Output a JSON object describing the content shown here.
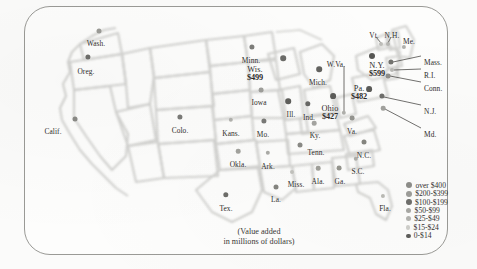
{
  "map": {
    "caption_line1": "(Value added",
    "caption_line2": "in millions of dollars)",
    "frame_color": "#9a9a96",
    "background_color": "#fdfdfc",
    "state_outline_color": "#c9c9c6"
  },
  "legend": {
    "items": [
      {
        "label": "over $400",
        "color": "#8e8e8a",
        "size": 6.2
      },
      {
        "label": "$200-$399",
        "color": "#9d9d99",
        "size": 6.0
      },
      {
        "label": "$100-$199",
        "color": "#6f6f6c",
        "size": 5.8
      },
      {
        "label": "$50-$99",
        "color": "#a8a8a4",
        "size": 5.4
      },
      {
        "label": "$25-$49",
        "color": "#b4b4b0",
        "size": 5.0
      },
      {
        "label": "$15-$24",
        "color": "#cfcfcb",
        "size": 4.4
      },
      {
        "label": "0-$14",
        "color": "#5e5e5b",
        "size": 4.6
      }
    ]
  },
  "states": [
    {
      "name": "Wash.",
      "value": null,
      "lx": 96,
      "ly": 40,
      "dx": 99,
      "dy": 31,
      "size": 5.0,
      "color": "#9b9b97",
      "align": "ctr"
    },
    {
      "name": "Oreg.",
      "value": null,
      "lx": 86,
      "ly": 68,
      "dx": 88,
      "dy": 57,
      "size": 5.2,
      "color": "#6e6e6b",
      "align": "ctr"
    },
    {
      "name": "Calif.",
      "value": null,
      "lx": 53,
      "ly": 128,
      "dx": 75,
      "dy": 119,
      "size": 5.0,
      "color": "#8a8a86",
      "align": "ctr"
    },
    {
      "name": "Colo.",
      "value": null,
      "lx": 180,
      "ly": 127,
      "dx": 180,
      "dy": 117,
      "size": 5.2,
      "color": "#7b7b78",
      "align": "ctr"
    },
    {
      "name": "Kans.",
      "value": null,
      "lx": 231,
      "ly": 130,
      "dx": 231,
      "dy": 120,
      "size": 4.4,
      "color": "#b2b2ae",
      "align": "ctr"
    },
    {
      "name": "Minn.",
      "value": null,
      "lx": 251,
      "ly": 57,
      "dx": 252,
      "dy": 47,
      "size": 5.2,
      "color": "#7d7d7a",
      "align": "ctr"
    },
    {
      "name": "Wis.",
      "value": "$499",
      "lx": 255,
      "ly": 66,
      "dx": 283,
      "dy": 58,
      "size": 5.6,
      "color": "#6c6c69",
      "align": "ctr"
    },
    {
      "name": "Iowa",
      "value": null,
      "lx": 259,
      "ly": 99,
      "dx": 261,
      "dy": 90,
      "size": 4.8,
      "color": "#9e9e9a",
      "align": "ctr"
    },
    {
      "name": "Mo.",
      "value": null,
      "lx": 263,
      "ly": 131,
      "dx": 264,
      "dy": 121,
      "size": 5.2,
      "color": "#7a7a77",
      "align": "ctr"
    },
    {
      "name": "Ill.",
      "value": null,
      "lx": 291,
      "ly": 111,
      "dx": 288,
      "dy": 101,
      "size": 5.6,
      "color": "#5f5f5c",
      "align": "ctr"
    },
    {
      "name": "Ind.",
      "value": null,
      "lx": 309,
      "ly": 114,
      "dx": 308,
      "dy": 104,
      "size": 5.4,
      "color": "#686865",
      "align": "ctr"
    },
    {
      "name": "Mich.",
      "value": null,
      "lx": 318,
      "ly": 79,
      "dx": 319,
      "dy": 69,
      "size": 5.6,
      "color": "#636360",
      "align": "ctr"
    },
    {
      "name": "Ohio",
      "value": "$427",
      "lx": 330,
      "ly": 105,
      "dx": 333,
      "dy": 96,
      "size": 5.8,
      "color": "#5c5c59",
      "align": "ctr"
    },
    {
      "name": "W.Va.",
      "value": null,
      "lx": 336,
      "ly": 61,
      "dx": 344,
      "dy": 113,
      "size": 4.4,
      "color": "#b0b0ac",
      "align": "ctr"
    },
    {
      "name": "Ky.",
      "value": null,
      "lx": 315,
      "ly": 132,
      "dx": 314,
      "dy": 123,
      "size": 4.6,
      "color": "#a5a5a1",
      "align": "ctr"
    },
    {
      "name": "Tenn.",
      "value": null,
      "lx": 316,
      "ly": 149,
      "dx": 300,
      "dy": 145,
      "size": 5.0,
      "color": "#8a8a86",
      "align": "ctr"
    },
    {
      "name": "Pa.",
      "value": "$482",
      "lx": 359,
      "ly": 85,
      "dx": 369,
      "dy": 89,
      "size": 5.8,
      "color": "#5b5b58",
      "align": "ctr"
    },
    {
      "name": "N.Y.",
      "value": "$599",
      "lx": 377,
      "ly": 62,
      "dx": 372,
      "dy": 56,
      "size": 6.0,
      "color": "#565653",
      "align": "ctr"
    },
    {
      "name": "Vt.",
      "value": null,
      "lx": 374,
      "ly": 32,
      "dx": 381,
      "dy": 44,
      "size": 4.0,
      "color": "#bdbdb9",
      "align": "ctr"
    },
    {
      "name": "N.H.",
      "value": null,
      "lx": 392,
      "ly": 32,
      "dx": 388,
      "dy": 44,
      "size": 4.0,
      "color": "#b5b5b1",
      "align": "ctr"
    },
    {
      "name": "Me.",
      "value": null,
      "lx": 409,
      "ly": 38,
      "dx": 404,
      "dy": 47,
      "size": 4.2,
      "color": "#b0b0ac",
      "align": "ctr"
    },
    {
      "name": "Mass.",
      "value": null,
      "lx": 424,
      "ly": 59,
      "dx": 391,
      "dy": 62,
      "size": 5.2,
      "color": "#73736f",
      "align": "lft"
    },
    {
      "name": "R.I.",
      "value": null,
      "lx": 424,
      "ly": 72,
      "dx": 392,
      "dy": 70,
      "size": 4.0,
      "color": "#b8b8b4",
      "align": "lft"
    },
    {
      "name": "Conn.",
      "value": null,
      "lx": 424,
      "ly": 85,
      "dx": 388,
      "dy": 76,
      "size": 4.8,
      "color": "#8e8e8a",
      "align": "lft"
    },
    {
      "name": "N.J.",
      "value": null,
      "lx": 424,
      "ly": 108,
      "dx": 382,
      "dy": 96,
      "size": 5.2,
      "color": "#6e6e6b",
      "align": "lft"
    },
    {
      "name": "Md.",
      "value": null,
      "lx": 424,
      "ly": 131,
      "dx": 383,
      "dy": 108,
      "size": 4.6,
      "color": "#a2a29e",
      "align": "lft"
    },
    {
      "name": "Va.",
      "value": null,
      "lx": 352,
      "ly": 128,
      "dx": 352,
      "dy": 118,
      "size": 4.8,
      "color": "#94948f",
      "align": "ctr"
    },
    {
      "name": "N.C.",
      "value": null,
      "lx": 364,
      "ly": 152,
      "dx": 364,
      "dy": 142,
      "size": 5.0,
      "color": "#85857f",
      "align": "ctr"
    },
    {
      "name": "S.C.",
      "value": null,
      "lx": 358,
      "ly": 168,
      "dx": 356,
      "dy": 159,
      "size": 4.4,
      "color": "#aeaea9",
      "align": "ctr"
    },
    {
      "name": "Ga.",
      "value": null,
      "lx": 340,
      "ly": 178,
      "dx": 339,
      "dy": 168,
      "size": 4.8,
      "color": "#96968f",
      "align": "ctr"
    },
    {
      "name": "Ala.",
      "value": null,
      "lx": 318,
      "ly": 178,
      "dx": 318,
      "dy": 168,
      "size": 4.6,
      "color": "#a0a09a",
      "align": "ctr"
    },
    {
      "name": "Miss.",
      "value": null,
      "lx": 296,
      "ly": 181,
      "dx": 292,
      "dy": 172,
      "size": 4.0,
      "color": "#c2c2bd",
      "align": "ctr"
    },
    {
      "name": "Ark.",
      "value": null,
      "lx": 268,
      "ly": 163,
      "dx": 268,
      "dy": 153,
      "size": 4.4,
      "color": "#acaca7",
      "align": "ctr"
    },
    {
      "name": "Okla.",
      "value": null,
      "lx": 238,
      "ly": 161,
      "dx": 238,
      "dy": 151,
      "size": 4.6,
      "color": "#a3a39e",
      "align": "ctr"
    },
    {
      "name": "La.",
      "value": null,
      "lx": 276,
      "ly": 196,
      "dx": 276,
      "dy": 187,
      "size": 5.0,
      "color": "#84847f",
      "align": "ctr"
    },
    {
      "name": "Tex.",
      "value": null,
      "lx": 226,
      "ly": 205,
      "dx": 226,
      "dy": 195,
      "size": 5.4,
      "color": "#6d6d69",
      "align": "ctr"
    },
    {
      "name": "Fla.",
      "value": null,
      "lx": 385,
      "ly": 205,
      "dx": 383,
      "dy": 196,
      "size": 4.2,
      "color": "#bbbbb6",
      "align": "ctr"
    }
  ],
  "leaders": [
    {
      "name": "leader-wva",
      "x1": 344,
      "y1": 66,
      "x2": 344,
      "y2": 112
    },
    {
      "name": "leader-vt",
      "x1": 376,
      "y1": 37,
      "x2": 381,
      "y2": 43
    },
    {
      "name": "leader-nh",
      "x1": 391,
      "y1": 37,
      "x2": 388,
      "y2": 43
    },
    {
      "name": "leader-mass",
      "x1": 421,
      "y1": 56,
      "x2": 393,
      "y2": 62
    },
    {
      "name": "leader-ri",
      "x1": 421,
      "y1": 69,
      "x2": 394,
      "y2": 70
    },
    {
      "name": "leader-conn",
      "x1": 421,
      "y1": 82,
      "x2": 390,
      "y2": 76
    },
    {
      "name": "leader-nj",
      "x1": 421,
      "y1": 105,
      "x2": 384,
      "y2": 97
    },
    {
      "name": "leader-md",
      "x1": 421,
      "y1": 128,
      "x2": 385,
      "y2": 109
    }
  ]
}
